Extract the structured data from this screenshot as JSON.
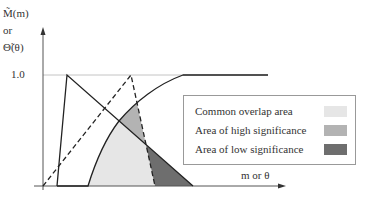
{
  "axes": {
    "y_label_lines": [
      "M̃(m)",
      "or",
      "Θ̃(θ)"
    ],
    "y_tick": "1.0",
    "x_label": "m or θ"
  },
  "legend": {
    "items": [
      {
        "label": "Common overlap area",
        "color": "#e6e6e6"
      },
      {
        "label": "Area of high significance",
        "color": "#b3b3b3"
      },
      {
        "label": "Area of low significance",
        "color": "#6e6e6e"
      }
    ]
  },
  "colors": {
    "axis": "#555555",
    "curve": "#222222",
    "reference_line": "#bbbbbb"
  }
}
